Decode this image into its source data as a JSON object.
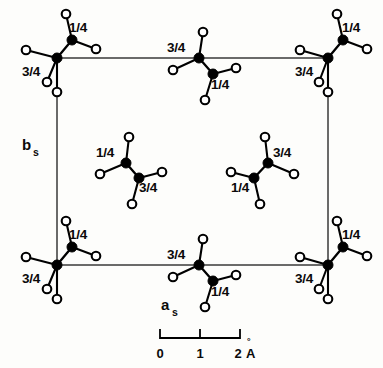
{
  "figure": {
    "background_color": "#fdfdfb",
    "line_color": "#3a3a3a",
    "atom_dark_color": "#000000",
    "atom_open_fill": "#ffffff"
  },
  "unit_cell": {
    "x": 57,
    "y": 58,
    "width": 271,
    "height": 207,
    "axis_a_label": "a",
    "axis_a_subscript": "s",
    "axis_b_label": "b",
    "axis_b_subscript": "s"
  },
  "scale_bar": {
    "ticks": [
      "0",
      "1",
      "2"
    ],
    "unit": "Å",
    "unit_ring": "°",
    "unit_letter": "A",
    "x_start": 160,
    "x_end": 240,
    "y": 338
  },
  "height_labels": {
    "quarter": "1/4",
    "three_quarter": "3/4"
  },
  "molecules": [
    {
      "id": "corner-top-left",
      "position": "top-left-corner",
      "atoms": [
        {
          "role": "lower",
          "label": "3/4",
          "label_x": 22,
          "label_y": 76,
          "cx": 57,
          "cy": 58,
          "ligands": [
            [
              26,
              50
            ],
            [
              47,
              82
            ],
            [
              57,
              92
            ]
          ]
        },
        {
          "role": "upper",
          "label": "1/4",
          "label_x": 69,
          "label_y": 32,
          "cx": 72,
          "cy": 40,
          "ligands": [
            [
              66,
              14
            ],
            [
              96,
              49
            ]
          ]
        }
      ]
    },
    {
      "id": "edge-top-center",
      "position": "top-edge-center",
      "atoms": [
        {
          "role": "upper",
          "label": "3/4",
          "label_x": 167,
          "label_y": 52,
          "cx": 199,
          "cy": 58,
          "ligands": [
            [
              203,
              32
            ],
            [
              173,
              70
            ]
          ]
        },
        {
          "role": "lower",
          "label": "1/4",
          "label_x": 211,
          "label_y": 89,
          "cx": 213,
          "cy": 74,
          "ligands": [
            [
              236,
              68
            ],
            [
              205,
              100
            ]
          ]
        }
      ]
    },
    {
      "id": "corner-top-right",
      "position": "top-right-corner",
      "atoms": [
        {
          "role": "lower",
          "label": "3/4",
          "label_x": 295,
          "label_y": 76,
          "cx": 328,
          "cy": 58,
          "ligands": [
            [
              300,
              50
            ],
            [
              319,
              82
            ],
            [
              328,
              92
            ]
          ]
        },
        {
          "role": "upper",
          "label": "1/4",
          "label_x": 342,
          "label_y": 32,
          "cx": 343,
          "cy": 40,
          "ligands": [
            [
              337,
              14
            ],
            [
              367,
              49
            ]
          ]
        }
      ]
    },
    {
      "id": "interior-left",
      "position": "interior-left",
      "atoms": [
        {
          "role": "upper",
          "label": "1/4",
          "label_x": 96,
          "label_y": 157,
          "cx": 126,
          "cy": 163,
          "ligands": [
            [
              129,
              137
            ],
            [
              100,
              174
            ]
          ]
        },
        {
          "role": "lower",
          "label": "3/4",
          "label_x": 139,
          "label_y": 192,
          "cx": 139,
          "cy": 178,
          "ligands": [
            [
              162,
              172
            ],
            [
              132,
              204
            ]
          ]
        }
      ]
    },
    {
      "id": "interior-right",
      "position": "interior-right",
      "atoms": [
        {
          "role": "upper",
          "label": "3/4",
          "label_x": 273,
          "label_y": 157,
          "cx": 268,
          "cy": 163,
          "ligands": [
            [
              265,
              137
            ],
            [
              294,
              174
            ]
          ]
        },
        {
          "role": "lower",
          "label": "1/4",
          "label_x": 231,
          "label_y": 192,
          "cx": 254,
          "cy": 178,
          "ligands": [
            [
              231,
              172
            ],
            [
              260,
              204
            ]
          ]
        }
      ]
    },
    {
      "id": "corner-bottom-left",
      "position": "bottom-left-corner",
      "atoms": [
        {
          "role": "lower",
          "label": "3/4",
          "label_x": 22,
          "label_y": 283,
          "cx": 57,
          "cy": 265,
          "ligands": [
            [
              26,
              257
            ],
            [
              47,
              289
            ],
            [
              57,
              299
            ]
          ]
        },
        {
          "role": "upper",
          "label": "1/4",
          "label_x": 69,
          "label_y": 239,
          "cx": 72,
          "cy": 247,
          "ligands": [
            [
              66,
              221
            ],
            [
              96,
              256
            ]
          ]
        }
      ]
    },
    {
      "id": "edge-bottom-center",
      "position": "bottom-edge-center",
      "atoms": [
        {
          "role": "upper",
          "label": "3/4",
          "label_x": 167,
          "label_y": 259,
          "cx": 199,
          "cy": 265,
          "ligands": [
            [
              203,
              239
            ],
            [
              173,
              277
            ]
          ]
        },
        {
          "role": "lower",
          "label": "1/4",
          "label_x": 211,
          "label_y": 296,
          "cx": 213,
          "cy": 281,
          "ligands": [
            [
              236,
              275
            ],
            [
              205,
              307
            ]
          ]
        }
      ]
    },
    {
      "id": "corner-bottom-right",
      "position": "bottom-right-corner",
      "atoms": [
        {
          "role": "lower",
          "label": "3/4",
          "label_x": 295,
          "label_y": 283,
          "cx": 328,
          "cy": 265,
          "ligands": [
            [
              300,
              257
            ],
            [
              319,
              289
            ],
            [
              328,
              299
            ]
          ]
        },
        {
          "role": "upper",
          "label": "1/4",
          "label_x": 342,
          "label_y": 239,
          "cx": 343,
          "cy": 247,
          "ligands": [
            [
              337,
              221
            ],
            [
              367,
              256
            ]
          ]
        }
      ]
    }
  ]
}
